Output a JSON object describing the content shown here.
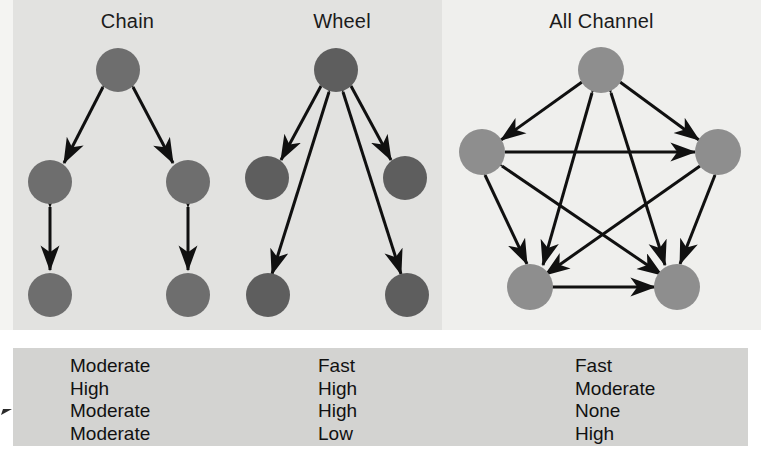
{
  "figure": {
    "panels": [
      {
        "id": "chain",
        "title": "Chain",
        "node_count": 5,
        "node_color": "#6e6e6e"
      },
      {
        "id": "wheel",
        "title": "Wheel",
        "node_count": 5,
        "node_color": "#5e5e5e"
      },
      {
        "id": "all-channel",
        "title": "All Channel",
        "node_count": 5,
        "node_color": "#8e8e8e"
      }
    ],
    "criteria_table": {
      "columns": [
        {
          "network": "Chain",
          "values": [
            "Moderate",
            "High",
            "Moderate",
            "Moderate"
          ]
        },
        {
          "network": "Wheel",
          "values": [
            "Fast",
            "High",
            "High",
            "Low"
          ]
        },
        {
          "network": "All Channel",
          "values": [
            "Fast",
            "Moderate",
            "None",
            "High"
          ]
        }
      ],
      "row_count": 4
    },
    "colors": {
      "page_background": "#ffffff",
      "band_background": "#f4f4f2",
      "panel_left_background": "#e2e2e0",
      "panel_right_background": "#efefed",
      "table_background": "#d3d3d1",
      "arrow_color": "#101010",
      "text_color": "#111111"
    }
  }
}
